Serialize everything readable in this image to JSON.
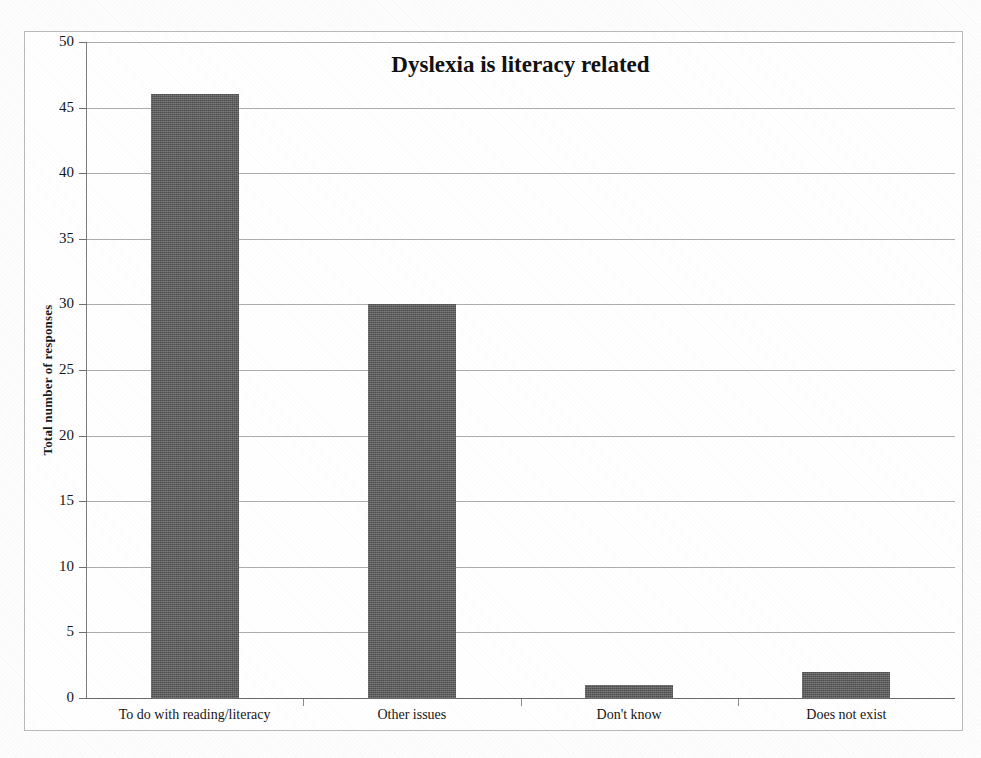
{
  "chart_data": {
    "type": "bar",
    "title": "Dyslexia is literacy related",
    "xlabel": "",
    "ylabel": "Total number of responses",
    "categories": [
      "To do with reading/literacy",
      "Other issues",
      "Don't know",
      "Does not exist"
    ],
    "values": [
      46,
      30,
      1,
      2
    ],
    "ylim": [
      0,
      50
    ],
    "ytick_labels": [
      "50",
      "45",
      "40",
      "35",
      "30",
      "25",
      "20",
      "15",
      "10",
      "5",
      "0"
    ],
    "ytick_values": [
      50,
      45,
      40,
      35,
      30,
      25,
      20,
      15,
      10,
      5,
      0
    ],
    "grid": true,
    "legend": "none",
    "bar_color": "#606060",
    "grid_color": "#8d8d8d",
    "axis_color": "#6a6a6a",
    "background_color": "#ffffff"
  }
}
